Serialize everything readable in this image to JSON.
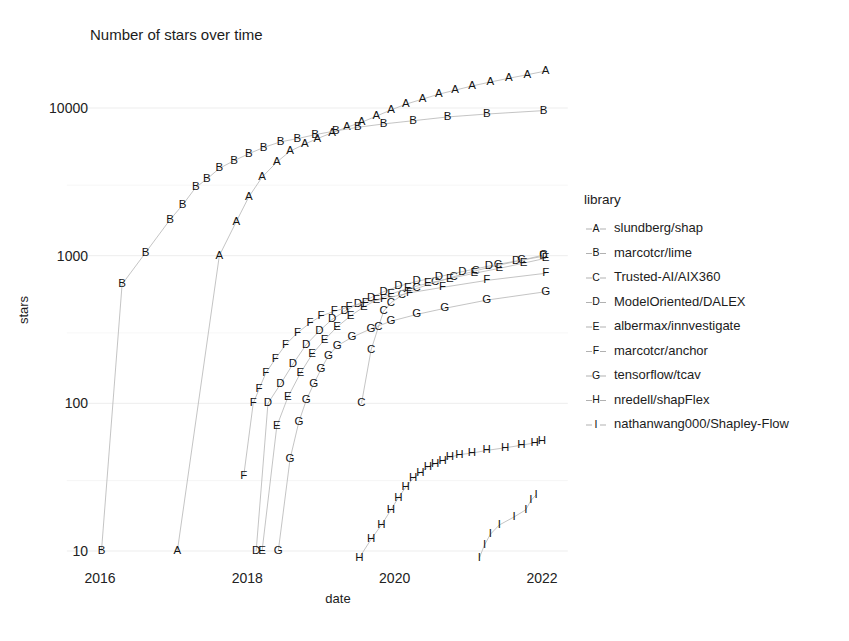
{
  "chart_data": {
    "type": "scatter",
    "title": "Number of stars over time",
    "xlabel": "date",
    "ylabel": "stars",
    "yscale": "log",
    "ylim": [
      7,
      22000
    ],
    "ytick_labels": [
      "10",
      "100",
      "1000",
      "10000"
    ],
    "ytick_values": [
      10,
      100,
      1000,
      10000
    ],
    "xlim": [
      2015.55,
      2022.35
    ],
    "xtick_labels": [
      "2016",
      "2018",
      "2020",
      "2022"
    ],
    "xtick_values": [
      2016,
      2018,
      2020,
      2022
    ],
    "grid": true,
    "legend_position": "right",
    "legend_title": "library",
    "series": [
      {
        "key": "A",
        "name": "slundberg/shap",
        "points": [
          [
            2017.05,
            10
          ],
          [
            2017.62,
            1000
          ],
          [
            2017.85,
            1700
          ],
          [
            2018.02,
            2500
          ],
          [
            2018.2,
            3400
          ],
          [
            2018.4,
            4300
          ],
          [
            2018.58,
            5100
          ],
          [
            2018.78,
            5700
          ],
          [
            2018.95,
            6200
          ],
          [
            2019.15,
            6800
          ],
          [
            2019.35,
            7400
          ],
          [
            2019.55,
            8000
          ],
          [
            2019.75,
            8800
          ],
          [
            2019.95,
            9700
          ],
          [
            2020.15,
            10600
          ],
          [
            2020.38,
            11500
          ],
          [
            2020.6,
            12400
          ],
          [
            2020.82,
            13200
          ],
          [
            2021.05,
            14100
          ],
          [
            2021.3,
            15000
          ],
          [
            2021.55,
            15900
          ],
          [
            2021.8,
            16800
          ],
          [
            2022.05,
            17800
          ]
        ]
      },
      {
        "key": "B",
        "name": "marcotcr/lime",
        "points": [
          [
            2016.02,
            10
          ],
          [
            2016.3,
            640
          ],
          [
            2016.62,
            1050
          ],
          [
            2016.95,
            1750
          ],
          [
            2017.12,
            2200
          ],
          [
            2017.3,
            2900
          ],
          [
            2017.45,
            3300
          ],
          [
            2017.62,
            3900
          ],
          [
            2017.82,
            4400
          ],
          [
            2018.02,
            4900
          ],
          [
            2018.22,
            5400
          ],
          [
            2018.45,
            5900
          ],
          [
            2018.68,
            6200
          ],
          [
            2018.92,
            6600
          ],
          [
            2019.2,
            7000
          ],
          [
            2019.5,
            7400
          ],
          [
            2019.85,
            7800
          ],
          [
            2020.25,
            8200
          ],
          [
            2020.72,
            8700
          ],
          [
            2021.25,
            9100
          ],
          [
            2022.02,
            9600
          ]
        ]
      },
      {
        "key": "C",
        "name": "Trusted-AI/AIX360",
        "points": [
          [
            2019.55,
            100
          ],
          [
            2019.68,
            230
          ],
          [
            2019.78,
            330
          ],
          [
            2019.85,
            420
          ],
          [
            2019.95,
            480
          ],
          [
            2020.1,
            540
          ],
          [
            2020.3,
            600
          ],
          [
            2020.55,
            660
          ],
          [
            2020.8,
            720
          ],
          [
            2021.1,
            790
          ],
          [
            2021.4,
            860
          ],
          [
            2021.72,
            930
          ],
          [
            2022.02,
            1010
          ]
        ]
      },
      {
        "key": "D",
        "name": "ModelOriented/DALEX",
        "points": [
          [
            2018.12,
            10
          ],
          [
            2018.28,
            100
          ],
          [
            2018.45,
            135
          ],
          [
            2018.62,
            185
          ],
          [
            2018.8,
            250
          ],
          [
            2018.98,
            310
          ],
          [
            2019.15,
            370
          ],
          [
            2019.32,
            420
          ],
          [
            2019.5,
            470
          ],
          [
            2019.68,
            520
          ],
          [
            2019.85,
            570
          ],
          [
            2020.05,
            620
          ],
          [
            2020.3,
            670
          ],
          [
            2020.6,
            720
          ],
          [
            2020.92,
            780
          ],
          [
            2021.28,
            850
          ],
          [
            2021.65,
            920
          ],
          [
            2022.02,
            990
          ]
        ]
      },
      {
        "key": "E",
        "name": "albermax/innvestigate",
        "points": [
          [
            2018.2,
            10
          ],
          [
            2018.4,
            70
          ],
          [
            2018.55,
            110
          ],
          [
            2018.72,
            160
          ],
          [
            2018.88,
            215
          ],
          [
            2019.05,
            270
          ],
          [
            2019.22,
            330
          ],
          [
            2019.4,
            390
          ],
          [
            2019.58,
            450
          ],
          [
            2019.75,
            500
          ],
          [
            2019.95,
            550
          ],
          [
            2020.18,
            600
          ],
          [
            2020.45,
            650
          ],
          [
            2020.75,
            700
          ],
          [
            2021.08,
            760
          ],
          [
            2021.42,
            820
          ],
          [
            2021.75,
            890
          ],
          [
            2022.05,
            960
          ]
        ]
      },
      {
        "key": "F",
        "name": "marcotcr/anchor",
        "points": [
          [
            2017.95,
            32
          ],
          [
            2018.08,
            100
          ],
          [
            2018.16,
            125
          ],
          [
            2018.25,
            160
          ],
          [
            2018.38,
            200
          ],
          [
            2018.52,
            250
          ],
          [
            2018.68,
            300
          ],
          [
            2018.85,
            350
          ],
          [
            2019.0,
            390
          ],
          [
            2019.18,
            420
          ],
          [
            2019.38,
            450
          ],
          [
            2019.6,
            480
          ],
          [
            2019.85,
            510
          ],
          [
            2020.2,
            560
          ],
          [
            2020.65,
            610
          ],
          [
            2021.25,
            680
          ],
          [
            2022.05,
            760
          ]
        ]
      },
      {
        "key": "G",
        "name": "tensorflow/tcav",
        "points": [
          [
            2018.42,
            10
          ],
          [
            2018.58,
            42
          ],
          [
            2018.7,
            75
          ],
          [
            2018.8,
            105
          ],
          [
            2018.9,
            135
          ],
          [
            2019.0,
            170
          ],
          [
            2019.1,
            210
          ],
          [
            2019.22,
            245
          ],
          [
            2019.42,
            280
          ],
          [
            2019.68,
            320
          ],
          [
            2019.95,
            360
          ],
          [
            2020.3,
            400
          ],
          [
            2020.68,
            440
          ],
          [
            2021.25,
            500
          ],
          [
            2022.05,
            570
          ]
        ]
      },
      {
        "key": "H",
        "name": "nredell/shapFlex",
        "points": [
          [
            2019.52,
            9
          ],
          [
            2019.68,
            12
          ],
          [
            2019.82,
            15
          ],
          [
            2019.95,
            19
          ],
          [
            2020.05,
            23
          ],
          [
            2020.15,
            27
          ],
          [
            2020.25,
            31
          ],
          [
            2020.35,
            34
          ],
          [
            2020.45,
            37
          ],
          [
            2020.55,
            39
          ],
          [
            2020.65,
            41
          ],
          [
            2020.75,
            43
          ],
          [
            2020.88,
            45
          ],
          [
            2021.05,
            46
          ],
          [
            2021.25,
            48
          ],
          [
            2021.5,
            50
          ],
          [
            2021.72,
            52
          ],
          [
            2021.9,
            54
          ],
          [
            2022.0,
            56
          ]
        ]
      },
      {
        "key": "I",
        "name": "nathanwang000/Shapley-Flow",
        "points": [
          [
            2021.15,
            9
          ],
          [
            2021.22,
            11
          ],
          [
            2021.3,
            13
          ],
          [
            2021.42,
            15
          ],
          [
            2021.62,
            17
          ],
          [
            2021.78,
            19
          ],
          [
            2021.85,
            22
          ],
          [
            2021.92,
            24
          ]
        ]
      }
    ]
  },
  "colors": {
    "background": "#ffffff",
    "grid": "#ebebeb",
    "line": "#b9b9b9",
    "text": "#1a1a1a"
  }
}
